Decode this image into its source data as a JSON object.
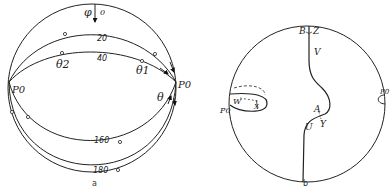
{
  "panel_a": {
    "caption": "a",
    "labels": {
      "phi": "φ",
      "zero": "0",
      "p0_left": "P0",
      "p0_right": "P0",
      "theta": "θ",
      "theta1": "θ1",
      "theta2": "θ2"
    },
    "curve_labels": [
      "20",
      "40",
      "160",
      "180"
    ]
  },
  "panel_b": {
    "caption": "b",
    "labels": {
      "B": "B",
      "Z": "Z",
      "V": "V",
      "A": "A",
      "Y": "Y",
      "U": "U",
      "W": "W",
      "X": "X",
      "p0_left": "P0",
      "p0_right": "P0"
    }
  }
}
